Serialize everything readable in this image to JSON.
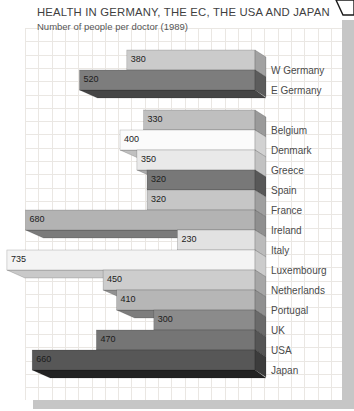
{
  "chart_data": {
    "type": "bar",
    "orientation": "horizontal",
    "title": "HEALTH IN GERMANY, THE EC, THE USA AND JAPAN",
    "subtitle": "Number of people per doctor (1989)",
    "xlim": [
      0,
      760
    ],
    "axes_shown": false,
    "legend": "none",
    "value_label_color": "#1c1c1c",
    "category_label_color": "#4a4a4a",
    "categories": [
      "W Germany",
      "E Germany",
      "Belgium",
      "Denmark",
      "Greece",
      "Spain",
      "France",
      "Ireland",
      "Italy",
      "Luxembourg",
      "Netherlands",
      "Portugal",
      "UK",
      "USA",
      "Japan"
    ],
    "values": [
      380,
      520,
      330,
      400,
      350,
      320,
      320,
      680,
      230,
      735,
      450,
      410,
      300,
      470,
      660
    ],
    "bars": [
      {
        "label": "W Germany",
        "value": 380,
        "group": 0,
        "face": "#cbcbcb",
        "side": "#a2a2a2",
        "bottom": "#8c8c8c"
      },
      {
        "label": "E Germany",
        "value": 520,
        "group": 0,
        "face": "#7d7d7d",
        "side": "#5c5c5c",
        "bottom": "#454545"
      },
      {
        "label": "Belgium",
        "value": 330,
        "group": 1,
        "face": "#bfbfbf",
        "side": "#9a9a9a",
        "bottom": "#868686"
      },
      {
        "label": "Denmark",
        "value": 400,
        "group": 1,
        "face": "#fbfbfb",
        "side": "#d2d2d2",
        "bottom": "#c0c0c0"
      },
      {
        "label": "Greece",
        "value": 350,
        "group": 1,
        "face": "#e9e9e9",
        "side": "#c2c2c2",
        "bottom": "#ababab"
      },
      {
        "label": "Spain",
        "value": 320,
        "group": 1,
        "face": "#787878",
        "side": "#585858",
        "bottom": "#424242"
      },
      {
        "label": "France",
        "value": 320,
        "group": 1,
        "face": "#c6c6c6",
        "side": "#9f9f9f",
        "bottom": "#888888"
      },
      {
        "label": "Ireland",
        "value": 680,
        "group": 1,
        "face": "#b3b3b3",
        "side": "#8f8f8f",
        "bottom": "#7b7b7b"
      },
      {
        "label": "Italy",
        "value": 230,
        "group": 1,
        "face": "#e2e2e2",
        "side": "#bbbbbb",
        "bottom": "#a5a5a5"
      },
      {
        "label": "Luxembourg",
        "value": 735,
        "group": 1,
        "face": "#f4f4f4",
        "side": "#cccccc",
        "bottom": "#c9c9c9"
      },
      {
        "label": "Netherlands",
        "value": 450,
        "group": 1,
        "face": "#cdcdcd",
        "side": "#a6a6a6",
        "bottom": "#919191"
      },
      {
        "label": "Portugal",
        "value": 410,
        "group": 1,
        "face": "#b6b6b6",
        "side": "#909090",
        "bottom": "#7d7d7d"
      },
      {
        "label": "UK",
        "value": 300,
        "group": 1,
        "face": "#8b8b8b",
        "side": "#6a6a6a",
        "bottom": "#525252"
      },
      {
        "label": "USA",
        "value": 470,
        "group": 1,
        "face": "#757575",
        "side": "#555555",
        "bottom": "#3e3e3e"
      },
      {
        "label": "Japan",
        "value": 660,
        "group": 1,
        "face": "#575757",
        "side": "#3c3c3c",
        "bottom": "#222222"
      }
    ]
  }
}
